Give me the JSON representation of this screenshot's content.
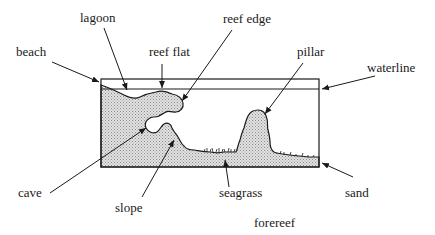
{
  "figure": {
    "type": "reef cross-section diagram",
    "labels": {
      "beach": "beach",
      "lagoon": "lagoon",
      "reef_flat": "reef flat",
      "reef_edge": "reef edge",
      "pillar": "pillar",
      "waterline": "waterline",
      "cave": "cave",
      "slope": "slope",
      "seagrass": "seagrass",
      "sand": "sand",
      "forereef": "forereef"
    },
    "colors": {
      "line": "#1a1a1a",
      "fill": "#d0d0d0",
      "background": "#ffffff"
    }
  }
}
